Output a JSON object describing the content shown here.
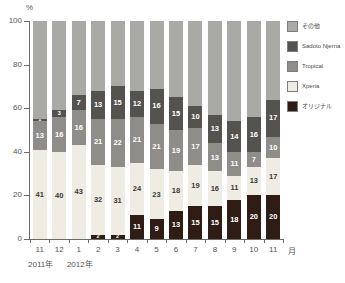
{
  "chart_data": {
    "type": "bar",
    "title": "",
    "subtitle": "",
    "stacked": true,
    "stack_mode": "percent",
    "xlabel": "月",
    "ylabel": "%",
    "ylim": [
      0,
      100
    ],
    "yticks": [
      0,
      20,
      40,
      60,
      80,
      100
    ],
    "grid": false,
    "legend_position": "right",
    "categories": [
      "11",
      "12",
      "1",
      "2",
      "3",
      "4",
      "5",
      "6",
      "7",
      "8",
      "9",
      "10",
      "11"
    ],
    "year_groups": [
      {
        "label": "2011年",
        "months": [
          "11",
          "12"
        ]
      },
      {
        "label": "2012年",
        "months": [
          "1",
          "2",
          "3",
          "4",
          "5",
          "6",
          "7",
          "8",
          "9",
          "10",
          "11"
        ]
      }
    ],
    "series": [
      {
        "name": "オリジナル",
        "color": "#2e1c15",
        "values": [
          0,
          0,
          0,
          2,
          2,
          11,
          9,
          13,
          15,
          15,
          18,
          20,
          20
        ]
      },
      {
        "name": "Xperia",
        "color": "#efece4",
        "values": [
          41,
          40,
          43,
          32,
          31,
          24,
          23,
          18,
          19,
          16,
          11,
          13,
          17
        ]
      },
      {
        "name": "Tropical",
        "color": "#8f8d89",
        "values": [
          13,
          16,
          16,
          21,
          22,
          21,
          21,
          19,
          17,
          13,
          11,
          7,
          10
        ]
      },
      {
        "name": "Sadoto Njerna",
        "color": "#555350",
        "values": [
          1,
          3,
          7,
          13,
          15,
          12,
          16,
          15,
          10,
          13,
          14,
          16,
          17
        ]
      },
      {
        "name": "その他",
        "color": "#a9a9a6",
        "values": [
          45,
          41,
          34,
          32,
          30,
          32,
          31,
          35,
          39,
          43,
          46,
          44,
          36
        ]
      }
    ]
  },
  "axis": {
    "y_unit": "%",
    "y_ticks": [
      "0",
      "20",
      "40",
      "60",
      "80",
      "100"
    ],
    "x_unit": "月"
  },
  "legend": {
    "items": [
      {
        "label": "その他",
        "color": "#a9a9a6"
      },
      {
        "label": "Sadoto Njerna",
        "color": "#555350"
      },
      {
        "label": "Tropical",
        "color": "#8f8d89"
      },
      {
        "label": "Xperia",
        "color": "#efece4"
      },
      {
        "label": "オリジナル",
        "color": "#2e1c15"
      }
    ]
  }
}
